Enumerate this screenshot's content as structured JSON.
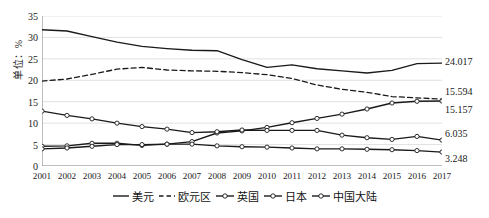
{
  "chart_data": {
    "type": "line",
    "title": "",
    "xlabel": "",
    "ylabel": "单位：%",
    "ylim": [
      0,
      35
    ],
    "yticks": [
      0,
      5,
      10,
      15,
      20,
      25,
      30,
      35
    ],
    "grid": true,
    "legend_position": "bottom",
    "categories": [
      "2001",
      "2002",
      "2003",
      "2004",
      "2005",
      "2006",
      "2007",
      "2008",
      "2009",
      "2010",
      "2011",
      "2012",
      "2013",
      "2014",
      "2015",
      "2016",
      "2017"
    ],
    "series": [
      {
        "name": "美元",
        "style": "solid",
        "marker": "none",
        "end_label": "24.017",
        "values": [
          31.8,
          31.5,
          30.2,
          28.9,
          27.9,
          27.4,
          27.0,
          26.9,
          24.8,
          23.0,
          23.6,
          22.7,
          22.2,
          21.7,
          22.3,
          23.9,
          24.017
        ]
      },
      {
        "name": "欧元区",
        "style": "dashed",
        "marker": "none",
        "end_label": "15.594",
        "values": [
          19.8,
          20.3,
          21.4,
          22.6,
          23.0,
          22.4,
          22.2,
          22.1,
          21.8,
          21.3,
          20.4,
          18.9,
          17.9,
          17.2,
          16.2,
          15.9,
          15.594
        ]
      },
      {
        "name": "英国",
        "style": "solid",
        "marker": "circle",
        "end_label": "15.157",
        "values": [
          4.6,
          4.7,
          5.3,
          5.3,
          4.8,
          5.1,
          5.7,
          7.7,
          8.2,
          9.0,
          10.1,
          11.1,
          12.1,
          13.3,
          14.7,
          15.1,
          15.157
        ]
      },
      {
        "name": "日本",
        "style": "solid",
        "marker": "circle",
        "end_label": "6.035",
        "values": [
          12.8,
          11.8,
          11.0,
          10.0,
          9.2,
          8.6,
          7.8,
          8.0,
          8.4,
          8.3,
          8.3,
          8.3,
          7.2,
          6.6,
          6.2,
          6.9,
          6.035
        ]
      },
      {
        "name": "中国大陆",
        "style": "solid",
        "marker": "circle",
        "end_label": "3.248",
        "values": [
          4.0,
          4.2,
          4.6,
          5.0,
          5.0,
          5.1,
          5.1,
          4.7,
          4.5,
          4.4,
          4.2,
          4.0,
          4.0,
          3.9,
          3.8,
          3.6,
          3.248
        ]
      }
    ],
    "data_labels": [
      {
        "text": "24.017",
        "series": "美元"
      },
      {
        "text": "15.594",
        "series": "欧元区"
      },
      {
        "text": "15.157",
        "series": "英国"
      },
      {
        "text": "6.035",
        "series": "日本"
      },
      {
        "text": "3.248",
        "series": "中国大陆"
      }
    ],
    "colors": {
      "line": "#1a1a1a",
      "grid": "#d9d9d9",
      "axis": "#808080",
      "background": "#ffffff"
    }
  }
}
